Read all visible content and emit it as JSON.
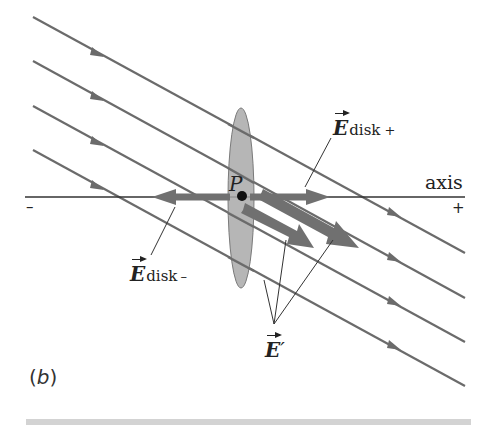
{
  "figure": {
    "panel_label_open": "(",
    "panel_label_letter": "b",
    "panel_label_close": ")",
    "point_label": "P",
    "axis_label": "axis",
    "axis_minus_sign": "–",
    "axis_plus_sign": "+",
    "labels": {
      "e_disk_plus": {
        "symbol": "E",
        "subscript": "disk",
        "sign": "+"
      },
      "e_disk_minus": {
        "symbol": "E",
        "subscript": "disk",
        "sign": "–"
      },
      "e_prime": {
        "symbol": "E",
        "prime": "′"
      }
    },
    "colors": {
      "field_line": "#6b6b6b",
      "vector_arrow": "#707070",
      "disk_fill": "#a9a9a9",
      "disk_stroke": "#7a7a7a",
      "text": "#222222",
      "bottom_rule": "#d3d3d3"
    },
    "field_lines": [
      {
        "x1": 33,
        "y1": 17,
        "x2": 465,
        "y2": 253
      },
      {
        "x1": 33,
        "y1": 61,
        "x2": 465,
        "y2": 298
      },
      {
        "x1": 33,
        "y1": 106,
        "x2": 465,
        "y2": 342
      },
      {
        "x1": 33,
        "y1": 150,
        "x2": 465,
        "y2": 386
      }
    ],
    "field_direction": "down-right"
  }
}
